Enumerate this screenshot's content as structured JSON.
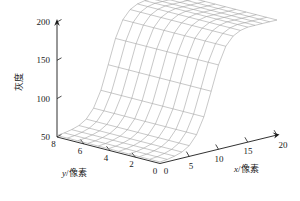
{
  "figure": {
    "type": "3d-surface-wireframe",
    "background_color": "#ffffff",
    "mesh_color": "#9a9a9a",
    "axis_color": "#1a1a1a",
    "text_color": "#1a1a1a"
  },
  "axes": {
    "z": {
      "title": "灰度",
      "ticks": [
        "200",
        "150",
        "100",
        "50"
      ],
      "tick_values": [
        200,
        150,
        100,
        50
      ],
      "range": [
        50,
        200
      ]
    },
    "y": {
      "title_italic": "y",
      "title_rest": "/像素",
      "title": "y/像素",
      "ticks": [
        "8",
        "6",
        "4",
        "2",
        "0"
      ],
      "tick_values": [
        8,
        6,
        4,
        2,
        0
      ],
      "range": [
        0,
        8
      ]
    },
    "x": {
      "title_italic": "x",
      "title_rest": "/像素",
      "title": "x/像素",
      "ticks": [
        "0",
        "5",
        "10",
        "15",
        "20"
      ],
      "tick_values": [
        0,
        5,
        10,
        15,
        20
      ],
      "range": [
        0,
        20
      ]
    }
  },
  "chart_data": {
    "type": "surface",
    "title": "",
    "xlabel": "x/像素",
    "ylabel": "y/像素",
    "zlabel": "灰度",
    "xlim": [
      0,
      20
    ],
    "ylim": [
      0,
      8
    ],
    "zlim": [
      50,
      200
    ],
    "grid": false,
    "legend": "none",
    "x": [
      0,
      1.25,
      2.5,
      3.75,
      5,
      6.25,
      7.5,
      8.75,
      10,
      11.25,
      12.5,
      13.75,
      15,
      16.25,
      17.5,
      18.75,
      20
    ],
    "y": [
      0,
      0.8,
      1.6,
      2.4,
      3.2,
      4,
      4.8,
      5.6,
      6.4,
      7.2,
      8
    ],
    "z_profile_along_x": [
      52,
      53,
      55,
      58,
      64,
      76,
      97,
      128,
      160,
      182,
      193,
      198,
      200,
      200,
      200,
      200,
      200
    ],
    "z_constant_along_y": true
  }
}
